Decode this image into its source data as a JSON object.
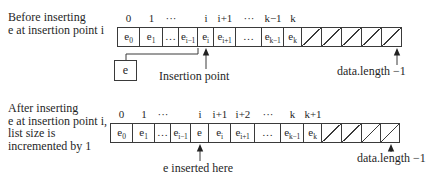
{
  "colors": {
    "line": "#3a3a3a",
    "text": "#1f1f1f",
    "background": "#ffffff"
  },
  "diagrams": [
    {
      "name": "before-insertion",
      "caption_lines": [
        "Before inserting",
        "e at insertion point i"
      ],
      "cells": [
        {
          "index": "0",
          "base": "e",
          "sub": "0"
        },
        {
          "index": "1",
          "base": "e",
          "sub": "1"
        },
        {
          "index": "···",
          "dots": "…"
        },
        {
          "index": "",
          "base": "e",
          "sub": "i−1"
        },
        {
          "index": "i",
          "base": "e",
          "sub": "i"
        },
        {
          "index": "i+1",
          "base": "e",
          "sub": "i+1"
        },
        {
          "index": "···",
          "dots": "…"
        },
        {
          "index": "k−1",
          "base": "e",
          "sub": "k−1"
        },
        {
          "index": "k",
          "base": "e",
          "sub": "k"
        },
        {
          "free": true
        },
        {
          "free": true
        },
        {
          "free": true
        },
        {
          "free": true
        },
        {
          "free": true
        }
      ],
      "annotations": {
        "inserted_element_label": "e",
        "pointer_label": "Insertion point",
        "capacity_label": "data.length −1"
      }
    },
    {
      "name": "after-insertion",
      "caption_lines": [
        "After inserting",
        "e at insertion point i,",
        "list size is",
        "incremented by 1"
      ],
      "cells": [
        {
          "index": "0",
          "base": "e",
          "sub": "0"
        },
        {
          "index": "1",
          "base": "e",
          "sub": "1"
        },
        {
          "index": "···",
          "dots": "…"
        },
        {
          "index": "",
          "base": "e",
          "sub": "i−1"
        },
        {
          "index": "i",
          "base": "e",
          "sub": ""
        },
        {
          "index": "i+1",
          "base": "e",
          "sub": "i"
        },
        {
          "index": "i+2",
          "base": "e",
          "sub": "i+1"
        },
        {
          "index": "···",
          "dots": "…"
        },
        {
          "index": "k",
          "base": "e",
          "sub": "k−1"
        },
        {
          "index": "k+1",
          "base": "e",
          "sub": "k"
        },
        {
          "free": true
        },
        {
          "free": true
        },
        {
          "free": true
        },
        {
          "free": true
        }
      ],
      "annotations": {
        "pointer_label": "e inserted here",
        "capacity_label": "data.length −1"
      }
    }
  ]
}
